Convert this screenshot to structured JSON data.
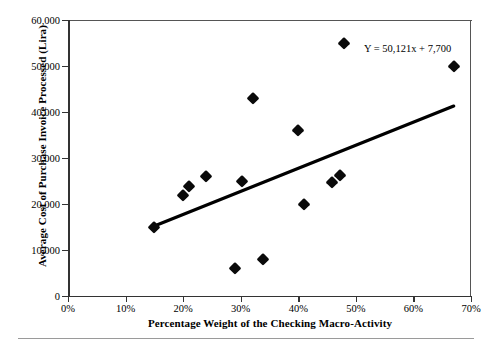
{
  "chart_data": {
    "type": "scatter",
    "title": "",
    "xlabel": "Percentage Weight of the Checking Macro-Activity",
    "ylabel": "Average Cost of Purchase Invoice Processed (Lira)",
    "xlim": [
      0,
      70
    ],
    "ylim": [
      0,
      60000
    ],
    "grid": false,
    "legend": null,
    "x_tick_labels": [
      "0%",
      "10%",
      "20%",
      "30%",
      "40%",
      "50%",
      "60%",
      "70%"
    ],
    "x_tick_values": [
      0,
      10,
      20,
      30,
      40,
      50,
      60,
      70
    ],
    "y_tick_labels": [
      "0",
      "10,000",
      "20,000",
      "30,000",
      "40,000",
      "50,000",
      "60,000"
    ],
    "y_tick_values": [
      0,
      10000,
      20000,
      30000,
      40000,
      50000,
      60000
    ],
    "x_unit": "percent",
    "y_unit": "Lira",
    "points": [
      {
        "x": 15.0,
        "y": 15000
      },
      {
        "x": 20.0,
        "y": 22000
      },
      {
        "x": 21.0,
        "y": 24000
      },
      {
        "x": 24.0,
        "y": 26000
      },
      {
        "x": 29.0,
        "y": 6000
      },
      {
        "x": 30.2,
        "y": 25000
      },
      {
        "x": 32.2,
        "y": 43000
      },
      {
        "x": 33.8,
        "y": 8000
      },
      {
        "x": 40.0,
        "y": 36000
      },
      {
        "x": 41.0,
        "y": 20000
      },
      {
        "x": 45.9,
        "y": 24800
      },
      {
        "x": 47.2,
        "y": 26200
      },
      {
        "x": 47.9,
        "y": 55000
      },
      {
        "x": 67.0,
        "y": 50100
      }
    ],
    "marker": {
      "shape": "diamond",
      "color": "#0a0a0a",
      "size": 8.5
    },
    "trendline": {
      "equation_label": "Y = 50,121x + 7,700",
      "slope": 50121,
      "intercept": 7700,
      "color": "#000000",
      "x_start": 15.0,
      "x_end": 67.0,
      "y_start": 15218,
      "y_end": 41281
    },
    "annotations": [
      {
        "text": "Y = 50,121x + 7,700",
        "x": 52.0,
        "y": 51500
      }
    ]
  }
}
